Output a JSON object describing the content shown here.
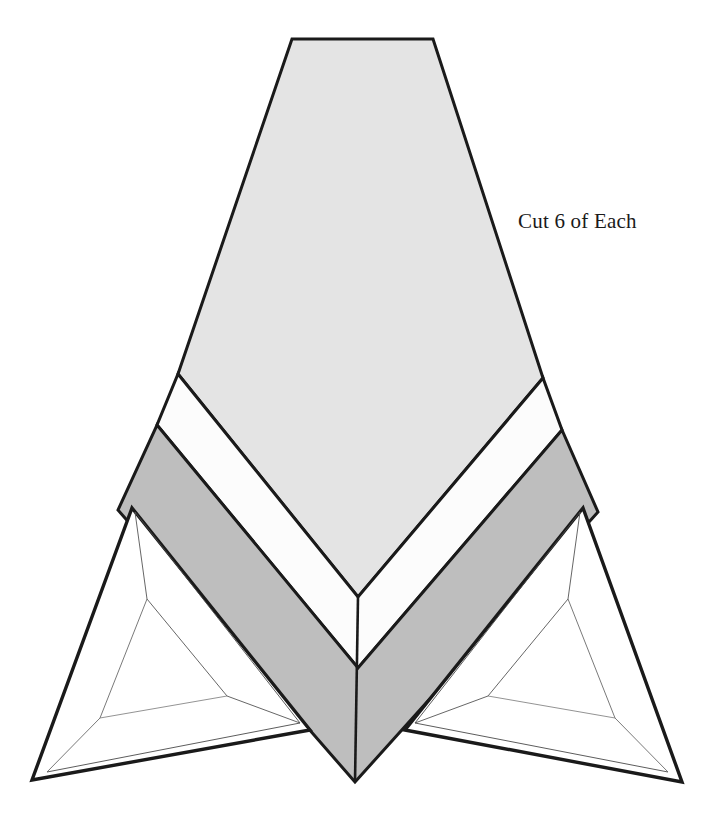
{
  "document": {
    "title": "Quilt Block Cutting Pattern",
    "background_color": "#ffffff",
    "width": 722,
    "height": 838
  },
  "annotations": [
    {
      "id": "cut-instruction",
      "text": "Cut 6 of Each",
      "x": 518,
      "y": 228,
      "font_size": 21,
      "color": "#1a1a1a"
    }
  ],
  "palette": {
    "outline": "#1a1a1a",
    "hairline": "#4a4a4a",
    "light_gray_fill": "#e4e4e4",
    "mid_gray_fill": "#bebebe",
    "white_fill": "#fcfcfc",
    "page_background": "#ffffff"
  },
  "stroke_widths": {
    "outer_outline": 3.4,
    "piece_outline": 3.0,
    "inner_hairline": 0.9
  },
  "pieces": [
    {
      "name": "center-kite-light",
      "label": "Light gray center kite (top trapezoid into chevron point)",
      "fill": "#e4e4e4",
      "stroke": "#1a1a1a",
      "stroke_width": 3.0,
      "points": "292,39 433,39 543,378 358,597 178,374"
    },
    {
      "name": "chevron-band-white",
      "label": "White chevron band",
      "fill": "#fcfcfc",
      "stroke": "#1a1a1a",
      "stroke_width": 3.0,
      "points": "178,374 358,597 543,378 562,430 358,668 157,425"
    },
    {
      "name": "chevron-band-dark",
      "label": "Dark gray chevron band",
      "fill": "#bebebe",
      "stroke": "#1a1a1a",
      "stroke_width": 3.0,
      "points": "157,425 358,668 562,430 598,512 355,782 118,510"
    },
    {
      "name": "wing-left",
      "label": "Left lower wing triangle",
      "fill": "#ffffff",
      "stroke": "#1a1a1a",
      "stroke_width": 3.4,
      "points": "132,508 310,730 32,780"
    },
    {
      "name": "wing-right",
      "label": "Right lower wing triangle",
      "fill": "#ffffff",
      "stroke": "#1a1a1a",
      "stroke_width": 3.4,
      "points": "583,508 405,730 682,782"
    }
  ],
  "inner_guides": [
    {
      "name": "wing-left-inner-outline",
      "fill": "none",
      "stroke": "#4a4a4a",
      "stroke_width": 0.9,
      "points": "135,512 300,723 47,772"
    },
    {
      "name": "wing-left-inner-core",
      "fill": "none",
      "stroke": "#555555",
      "stroke_width": 0.9,
      "points": "135,512 147,599 227,696 300,723"
    },
    {
      "name": "wing-left-inner-base",
      "fill": "none",
      "stroke": "#6a6a6a",
      "stroke_width": 0.9,
      "points": "147,599 100,718 47,772"
    },
    {
      "name": "wing-left-inner-connector",
      "fill": "none",
      "stroke": "#777777",
      "stroke_width": 0.8,
      "points": "100,718 227,696"
    },
    {
      "name": "wing-right-inner-outline",
      "fill": "none",
      "stroke": "#4a4a4a",
      "stroke_width": 0.9,
      "points": "580,512 415,723 668,772"
    },
    {
      "name": "wing-right-inner-core",
      "fill": "none",
      "stroke": "#555555",
      "stroke_width": 0.9,
      "points": "580,512 568,599 488,696 415,723"
    },
    {
      "name": "wing-right-inner-base",
      "fill": "none",
      "stroke": "#6a6a6a",
      "stroke_width": 0.9,
      "points": "568,599 615,718 668,772"
    },
    {
      "name": "wing-right-inner-connector",
      "fill": "none",
      "stroke": "#777777",
      "stroke_width": 0.8,
      "points": "615,718 488,696"
    }
  ],
  "accent_edges": [
    {
      "name": "center-seam-line",
      "stroke": "#1a1a1a",
      "stroke_width": 2.6,
      "d": "M 358,597 L 355,782"
    }
  ]
}
